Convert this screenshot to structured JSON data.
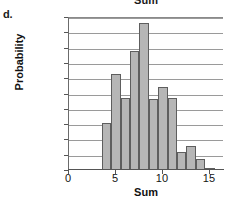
{
  "part_label": "d.",
  "chart_data": {
    "type": "bar",
    "title": "Sum",
    "xlabel": "Sum",
    "ylabel": "Probability",
    "grid": true,
    "legend": "none",
    "xlim": [
      0,
      16.5
    ],
    "ylim": [
      0,
      0.2
    ],
    "xticks": [
      0,
      5,
      10,
      15
    ],
    "xtick_labels": [
      "0",
      "5",
      "10",
      "15"
    ],
    "yticks": [
      0,
      0.02,
      0.04,
      0.06,
      0.08,
      0.1,
      0.12,
      0.14,
      0.16,
      0.18,
      0.2
    ],
    "ytick_labels": [
      "0",
      "0.02",
      "0.04",
      "0.06",
      "0.08",
      "0.1",
      "0.12",
      "0.14",
      "0.16",
      "0.18",
      "0.2"
    ],
    "bar_width": 1,
    "bar_color": "#b6b6b6",
    "bar_edge_color": "#5e5e5e",
    "categories": [
      4,
      5,
      6,
      7,
      8,
      9,
      10,
      11,
      12,
      13,
      14,
      15
    ],
    "values": [
      0.062,
      0.125,
      0.094,
      0.156,
      0.192,
      0.093,
      0.109,
      0.094,
      0.023,
      0.031,
      0.015,
      0.003
    ],
    "points": [
      {
        "sum": 4,
        "probability": 0.062
      },
      {
        "sum": 5,
        "probability": 0.125
      },
      {
        "sum": 6,
        "probability": 0.094
      },
      {
        "sum": 7,
        "probability": 0.156
      },
      {
        "sum": 8,
        "probability": 0.192
      },
      {
        "sum": 9,
        "probability": 0.093
      },
      {
        "sum": 10,
        "probability": 0.109
      },
      {
        "sum": 11,
        "probability": 0.094
      },
      {
        "sum": 12,
        "probability": 0.023
      },
      {
        "sum": 13,
        "probability": 0.031
      },
      {
        "sum": 14,
        "probability": 0.015
      },
      {
        "sum": 15,
        "probability": 0.003
      }
    ]
  }
}
